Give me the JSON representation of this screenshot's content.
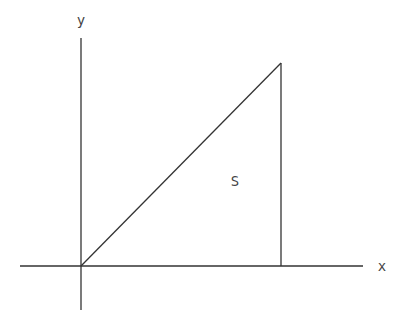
{
  "diagram": {
    "type": "geometry-plot",
    "stroke_color": "#333333",
    "label_color": "#444444",
    "background": "#ffffff",
    "axes": {
      "x": {
        "label": "x",
        "from": [
          20,
          266
        ],
        "to": [
          363,
          266
        ],
        "label_pos": [
          382,
          271
        ]
      },
      "y": {
        "label": "y",
        "from": [
          81,
          38
        ],
        "to": [
          81,
          310
        ],
        "label_pos": [
          81,
          25
        ]
      }
    },
    "triangle": {
      "vertices": [
        [
          81,
          266
        ],
        [
          281,
          63
        ],
        [
          281,
          266
        ]
      ],
      "region_label": "S",
      "region_label_pos": [
        235,
        181
      ]
    }
  }
}
